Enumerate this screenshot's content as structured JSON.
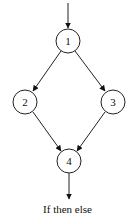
{
  "diagram": {
    "caption": "If then else",
    "nodes": [
      {
        "id": "1",
        "label": "1",
        "cx": 68,
        "cy": 41
      },
      {
        "id": "2",
        "label": "2",
        "cx": 25,
        "cy": 102
      },
      {
        "id": "3",
        "label": "3",
        "cx": 113,
        "cy": 102
      },
      {
        "id": "4",
        "label": "4",
        "cx": 69,
        "cy": 161
      }
    ],
    "edges": [
      {
        "from": "entry",
        "to": "1"
      },
      {
        "from": "1",
        "to": "2"
      },
      {
        "from": "1",
        "to": "3"
      },
      {
        "from": "2",
        "to": "4"
      },
      {
        "from": "3",
        "to": "4"
      },
      {
        "from": "4",
        "to": "exit"
      }
    ]
  }
}
